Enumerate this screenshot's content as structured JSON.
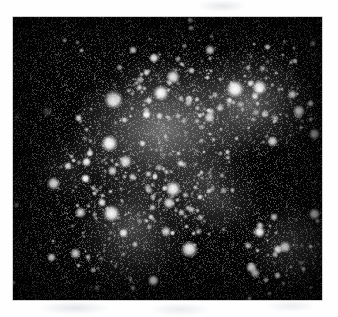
{
  "page": {
    "background_color": "#fefefe",
    "artifacts": [
      {
        "name": "scanner-smudge-top",
        "x": 198,
        "y": 0,
        "w": 48,
        "h": 12
      },
      {
        "name": "scanner-smudge-bottom-left",
        "x": 40,
        "y": 301,
        "w": 70,
        "h": 14
      },
      {
        "name": "scanner-smudge-bottom-center",
        "x": 150,
        "y": 303,
        "w": 60,
        "h": 13
      },
      {
        "name": "scanner-smudge-bottom-right",
        "x": 268,
        "y": 300,
        "w": 46,
        "h": 12
      }
    ]
  },
  "figure": {
    "kind": "astronomical-photograph",
    "color_mode": "grayscale",
    "frame": {
      "x": 13,
      "y": 17,
      "width": 309,
      "height": 283
    },
    "background_color": "#050505",
    "star_color": "#ffffff",
    "caption": "",
    "label": "",
    "axis_labels": [],
    "tick_labels": [],
    "legend": []
  },
  "chart_data": {
    "type": "scatter",
    "title": "",
    "xlabel": "",
    "ylabel": "",
    "xlim": [
      0,
      309
    ],
    "ylim": [
      0,
      283
    ],
    "grid": false,
    "legend_position": "none",
    "note": "Star positions in plate pixel coordinates; r = apparent radius, b = relative brightness 0-1",
    "glow_regions": [
      {
        "cx": 150,
        "cy": 112,
        "rx": 120,
        "ry": 96,
        "intensity": 0.62
      },
      {
        "cx": 236,
        "cy": 86,
        "rx": 88,
        "ry": 70,
        "intensity": 0.52
      },
      {
        "cx": 120,
        "cy": 210,
        "rx": 74,
        "ry": 80,
        "intensity": 0.44
      },
      {
        "cx": 200,
        "cy": 178,
        "rx": 66,
        "ry": 54,
        "intensity": 0.38
      },
      {
        "cx": 280,
        "cy": 228,
        "rx": 58,
        "ry": 52,
        "intensity": 0.32
      },
      {
        "cx": 60,
        "cy": 150,
        "rx": 52,
        "ry": 46,
        "intensity": 0.22
      }
    ],
    "dark_lanes": [
      {
        "cx": 252,
        "cy": 160,
        "rx": 70,
        "ry": 52,
        "opacity": 0.8
      },
      {
        "cx": 36,
        "cy": 90,
        "rx": 46,
        "ry": 86,
        "opacity": 0.78
      },
      {
        "cx": 178,
        "cy": 262,
        "rx": 54,
        "ry": 40,
        "opacity": 0.62
      },
      {
        "cx": 96,
        "cy": 62,
        "rx": 40,
        "ry": 34,
        "opacity": 0.55
      }
    ],
    "bright_stars": [
      {
        "x": 100,
        "y": 82,
        "r": 9.5,
        "b": 1.0
      },
      {
        "x": 148,
        "y": 76,
        "r": 8.0,
        "b": 0.98
      },
      {
        "x": 222,
        "y": 72,
        "r": 9.0,
        "b": 1.0
      },
      {
        "x": 246,
        "y": 70,
        "r": 7.5,
        "b": 0.96
      },
      {
        "x": 160,
        "y": 60,
        "r": 7.0,
        "b": 0.94
      },
      {
        "x": 96,
        "y": 126,
        "r": 8.5,
        "b": 0.99
      },
      {
        "x": 112,
        "y": 144,
        "r": 6.5,
        "b": 0.92
      },
      {
        "x": 160,
        "y": 172,
        "r": 8.0,
        "b": 0.97
      },
      {
        "x": 156,
        "y": 186,
        "r": 6.0,
        "b": 0.9
      },
      {
        "x": 98,
        "y": 196,
        "r": 8.5,
        "b": 0.98
      },
      {
        "x": 176,
        "y": 232,
        "r": 8.5,
        "b": 0.99
      },
      {
        "x": 40,
        "y": 166,
        "r": 6.5,
        "b": 0.93
      },
      {
        "x": 34,
        "y": 94,
        "r": 5.5,
        "b": 0.9
      },
      {
        "x": 272,
        "y": 230,
        "r": 6.0,
        "b": 0.91
      },
      {
        "x": 286,
        "y": 94,
        "r": 6.0,
        "b": 0.92
      },
      {
        "x": 196,
        "y": 100,
        "r": 5.5,
        "b": 0.88
      },
      {
        "x": 62,
        "y": 236,
        "r": 5.5,
        "b": 0.88
      },
      {
        "x": 242,
        "y": 256,
        "r": 5.0,
        "b": 0.86
      }
    ],
    "star_count_estimate": 900
  }
}
